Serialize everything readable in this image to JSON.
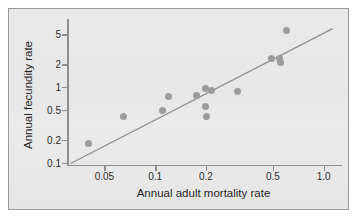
{
  "chart_data": {
    "type": "scatter",
    "title": "",
    "xlabel": "Annual adult mortality rate",
    "ylabel": "Annual fecundity rate",
    "xscale": "log",
    "yscale": "log",
    "grid": false,
    "legend": null,
    "xlim": [
      0.03,
      1.25
    ],
    "ylim": [
      0.09,
      7.0
    ],
    "xticks": [
      {
        "value": 0.05,
        "label": "0.05"
      },
      {
        "value": 0.1,
        "label": "0.1"
      },
      {
        "value": 0.2,
        "label": "0.2"
      },
      {
        "value": 0.5,
        "label": "0.5"
      },
      {
        "value": 1.0,
        "label": "1.0"
      }
    ],
    "yticks": [
      {
        "value": 0.1,
        "label": "0.1"
      },
      {
        "value": 0.2,
        "label": "0.2"
      },
      {
        "value": 0.5,
        "label": "0.5"
      },
      {
        "value": 1,
        "label": "1"
      },
      {
        "value": 2,
        "label": "2"
      },
      {
        "value": 5,
        "label": "5"
      }
    ],
    "points": [
      {
        "x": 0.04,
        "y": 0.18
      },
      {
        "x": 0.065,
        "y": 0.41
      },
      {
        "x": 0.11,
        "y": 0.49
      },
      {
        "x": 0.12,
        "y": 0.75
      },
      {
        "x": 0.175,
        "y": 0.78
      },
      {
        "x": 0.198,
        "y": 0.95
      },
      {
        "x": 0.2,
        "y": 0.55
      },
      {
        "x": 0.202,
        "y": 0.41
      },
      {
        "x": 0.215,
        "y": 0.9
      },
      {
        "x": 0.31,
        "y": 0.88
      },
      {
        "x": 0.49,
        "y": 2.4
      },
      {
        "x": 0.55,
        "y": 2.4
      },
      {
        "x": 0.555,
        "y": 2.1
      },
      {
        "x": 0.6,
        "y": 5.5
      }
    ],
    "reference_line": {
      "description": "straight trend line on log-log axes",
      "x_start": 0.0315,
      "y_start": 0.097,
      "x_end": 1.13,
      "y_end": 5.9
    },
    "colors": {
      "point_fill": "#9b9b9b",
      "line": "#8d8d8d",
      "axis": "#8d8d8d",
      "text": "#1f1f1f",
      "background": "#e8e8e8",
      "frame_border": "#9a9a9a",
      "page": "#ffffff"
    }
  }
}
